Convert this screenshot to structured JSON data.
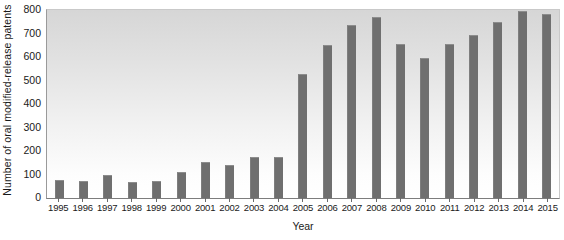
{
  "chart_data": {
    "type": "bar",
    "title": "",
    "xlabel": "Year",
    "ylabel": "Number of oral modified-release patents",
    "categories": [
      "1995",
      "1996",
      "1997",
      "1998",
      "1999",
      "2000",
      "2001",
      "2002",
      "2003",
      "2004",
      "2005",
      "2006",
      "2007",
      "2008",
      "2009",
      "2010",
      "2011",
      "2012",
      "2013",
      "2014",
      "2015"
    ],
    "values": [
      75,
      72,
      100,
      70,
      72,
      110,
      155,
      140,
      175,
      175,
      528,
      650,
      735,
      770,
      655,
      595,
      655,
      693,
      750,
      795,
      782
    ],
    "ylim": [
      0,
      800
    ],
    "yticks": [
      0,
      100,
      200,
      300,
      400,
      500,
      600,
      700,
      800
    ],
    "ytick_labels": [
      "0",
      "100",
      "200",
      "300",
      "400",
      "500",
      "600",
      "700",
      "800"
    ],
    "grid": false,
    "legend": false,
    "bar_color": "#6f6f6f",
    "plot_background_top": "#d6d6d6",
    "plot_background_bottom": "#ffffff",
    "axis_color": "#7d7d7d",
    "text_color": "#1a1a1a"
  }
}
